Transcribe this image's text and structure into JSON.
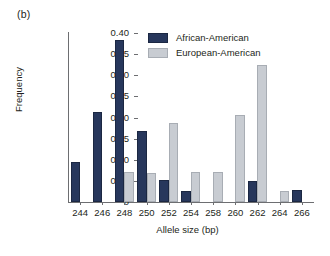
{
  "panel_label": "(b)",
  "chart_data": {
    "type": "bar",
    "title": "",
    "subtitle": "",
    "xlabel": "Allele size (bp)",
    "ylabel": "Frequency",
    "categories": [
      "244",
      "246",
      "248",
      "250",
      "252",
      "254",
      "258",
      "260",
      "262",
      "264",
      "266"
    ],
    "series": [
      {
        "name": "African-American",
        "color": "#27375c",
        "values": [
          0.095,
          0.214,
          0.383,
          0.168,
          0.052,
          0.027,
          0.0,
          0.0,
          0.049,
          0.0,
          0.029
        ]
      },
      {
        "name": "European-American",
        "color": "#c8ccd2",
        "values": [
          0.0,
          0.0,
          0.07,
          0.068,
          0.187,
          0.071,
          0.072,
          0.207,
          0.325,
          0.026,
          0.0
        ]
      }
    ],
    "ylim": [
      0,
      0.4
    ],
    "ytick_values": [
      0,
      0.05,
      0.1,
      0.15,
      0.2,
      0.25,
      0.3,
      0.35,
      0.4
    ],
    "ytick_labels": [
      "0",
      "0.05",
      "0.10",
      "0.15",
      "0.20",
      "0.25",
      "0.30",
      "0.35",
      "0.40"
    ],
    "grid": false,
    "legend_position": "top-center"
  },
  "legend": {
    "entries": [
      {
        "label": "African-American",
        "color": "#27375c"
      },
      {
        "label": "European-American",
        "color": "#c8ccd2"
      }
    ]
  }
}
